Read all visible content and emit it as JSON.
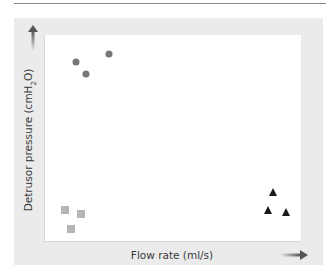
{
  "chart_data": {
    "type": "scatter",
    "title": "",
    "xlabel": "Flow rate (ml/s)",
    "ylabel": "Detrusor pressure (cmH₂O)",
    "xlim": [
      0,
      1
    ],
    "ylim": [
      0,
      1
    ],
    "grid": false,
    "legend": null,
    "axis_ticks": "none (axes indicated by arrows only)",
    "series": [
      {
        "name": "high pressure / low flow",
        "marker": "circle",
        "color": "#777777",
        "points": [
          {
            "x": 0.12,
            "y": 0.87
          },
          {
            "x": 0.16,
            "y": 0.81
          },
          {
            "x": 0.25,
            "y": 0.91
          }
        ]
      },
      {
        "name": "low pressure / low flow",
        "marker": "square",
        "color": "#b5b5b5",
        "points": [
          {
            "x": 0.08,
            "y": 0.15
          },
          {
            "x": 0.14,
            "y": 0.13
          },
          {
            "x": 0.1,
            "y": 0.06
          }
        ]
      },
      {
        "name": "low pressure / high flow",
        "marker": "triangle",
        "color": "#1a1a1a",
        "points": [
          {
            "x": 0.89,
            "y": 0.24
          },
          {
            "x": 0.87,
            "y": 0.15
          },
          {
            "x": 0.94,
            "y": 0.14
          }
        ]
      }
    ]
  },
  "labels": {
    "x_axis": "Flow rate (ml/s)",
    "y_axis": "Detrusor pressure (cmH₂O)"
  },
  "colors": {
    "panel": "#ebebeb",
    "plot": "#ffffff",
    "circle": "#777777",
    "square": "#b5b5b5",
    "triangle": "#1a1a1a",
    "text": "#3a3a3a"
  }
}
